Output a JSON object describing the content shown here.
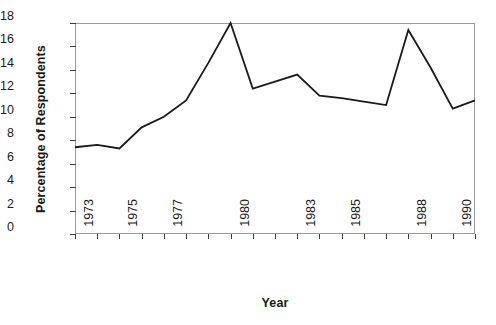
{
  "chart_data": {
    "type": "line",
    "title": "",
    "xlabel": "Year",
    "ylabel": "Percentage of Respondents",
    "x": [
      1973,
      1974,
      1975,
      1976,
      1977,
      1978,
      1979,
      1980,
      1981,
      1982,
      1983,
      1984,
      1985,
      1986,
      1987,
      1988,
      1989,
      1990,
      1991
    ],
    "values": [
      7.4,
      7.6,
      7.3,
      9.1,
      10.0,
      11.4,
      14.6,
      18.0,
      12.4,
      13.0,
      13.6,
      11.8,
      11.6,
      11.3,
      11.0,
      17.4,
      14.2,
      10.7,
      11.4
    ],
    "series": [
      {
        "name": "Percentage of Respondents",
        "values": [
          7.4,
          7.6,
          7.3,
          9.1,
          10.0,
          11.4,
          14.6,
          18.0,
          12.4,
          13.0,
          13.6,
          11.8,
          11.6,
          11.3,
          11.0,
          17.4,
          14.2,
          10.7,
          11.4
        ]
      }
    ],
    "ylim": [
      0,
      18
    ],
    "xlim": [
      1973,
      1991
    ],
    "y_ticks": [
      0,
      2,
      4,
      6,
      8,
      10,
      12,
      14,
      16,
      18
    ],
    "y_tick_labels": [
      "0",
      "2",
      "4",
      "6",
      "8",
      "10",
      "12",
      "14",
      "16",
      "18"
    ],
    "x_tick_years": [
      1973,
      1974,
      1975,
      1976,
      1977,
      1978,
      1979,
      1980,
      1981,
      1982,
      1983,
      1984,
      1985,
      1986,
      1987,
      1988,
      1989,
      1990,
      1991
    ],
    "x_tick_labels": [
      {
        "year": 1973,
        "label": "1973"
      },
      {
        "year": 1975,
        "label": "1975"
      },
      {
        "year": 1977,
        "label": "1977"
      },
      {
        "year": 1980,
        "label": "1980"
      },
      {
        "year": 1983,
        "label": "1983"
      },
      {
        "year": 1985,
        "label": "1985"
      },
      {
        "year": 1988,
        "label": "1988"
      },
      {
        "year": 1990,
        "label": "1990"
      }
    ],
    "grid": false,
    "legend": false,
    "legend_position": "none",
    "line_color": "#1a1a1a",
    "frame_color": "#9a9a9a",
    "background_color": "#ffffff"
  }
}
